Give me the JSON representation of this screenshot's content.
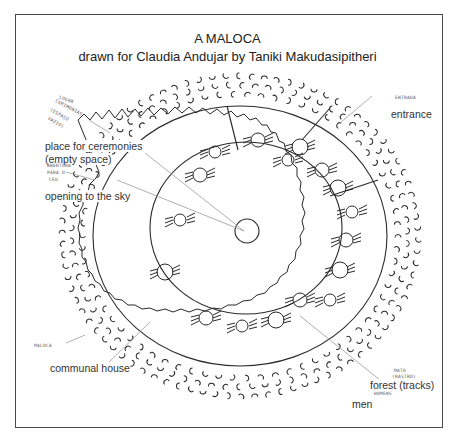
{
  "title": {
    "line1": "A MALOCA",
    "line2": "drawn for Claudia Andujar by Taniki Makudasipitheri"
  },
  "labels": {
    "ceremonies_line1": "place for ceremonies",
    "ceremonies_line2": "(empty space)",
    "sky": "opening to the sky",
    "entrance": "entrance",
    "communal_house": "communal house",
    "forest": "forest (tracks)",
    "men": "men"
  },
  "handwritten_labels": {
    "top_left_1": "LUGAR",
    "top_left_2": "CERIMONIAS",
    "top_left_3": "(ESPAÇO",
    "top_left_4": "VAZIO)",
    "sky_1": "ABERTURA",
    "sky_2": "PARA O",
    "sky_3": "CÉU",
    "entrance": "ENTRADA",
    "communal": "MALOCA",
    "forest_1": "MATO",
    "forest_2": "(RASTRO)",
    "men": "HOMENS"
  },
  "colors": {
    "ink": "#2a2a2a",
    "leader_line": "#9a9a9a",
    "frame": "#4a4a4a",
    "background": "#ffffff"
  }
}
